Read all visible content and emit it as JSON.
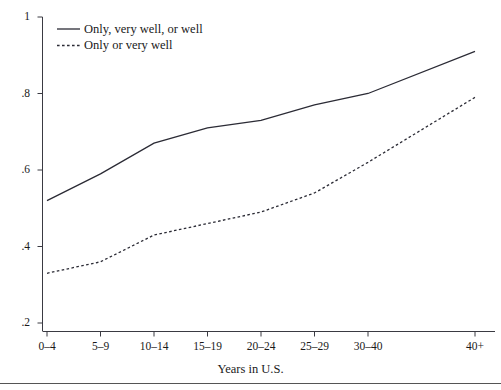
{
  "chart_data": {
    "type": "line",
    "title": "",
    "xlabel": "Years in U.S.",
    "ylabel": "",
    "categories": [
      "0–4",
      "5–9",
      "10–14",
      "15–19",
      "20–24",
      "25–29",
      "30–40",
      "40+"
    ],
    "ylim": [
      0.2,
      1
    ],
    "yticks": [
      "1",
      ".8",
      ".6",
      ".4",
      ".2"
    ],
    "ytick_values": [
      1,
      0.8,
      0.6,
      0.4,
      0.2
    ],
    "grid": false,
    "legend_position": "top-left",
    "series": [
      {
        "name": "Only, very well, or well",
        "style": "solid",
        "color": "#2b2b35",
        "values": [
          0.52,
          0.59,
          0.67,
          0.71,
          0.73,
          0.77,
          0.8,
          0.91
        ]
      },
      {
        "name": "Only or very well",
        "style": "dotted",
        "color": "#2b2b35",
        "values": [
          0.33,
          0.36,
          0.43,
          0.46,
          0.49,
          0.54,
          0.62,
          0.79
        ]
      }
    ]
  },
  "axis": {
    "x_title": "Years in U.S."
  },
  "legend": {
    "entries": [
      {
        "label": "Only, very well, or well"
      },
      {
        "label": "Only or very well"
      }
    ]
  }
}
